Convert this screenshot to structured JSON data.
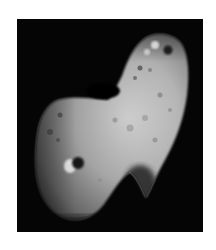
{
  "image": {
    "subject": "asteroid",
    "alt": "Grayscale photograph of an elongated, cratered asteroid against a black sky",
    "colors": {
      "page_background": "#ffffff",
      "sky": "#050505",
      "surface_light": "#d8d8d8",
      "surface_mid": "#9a9a9a",
      "surface_shadow": "#2a2a2a"
    }
  }
}
